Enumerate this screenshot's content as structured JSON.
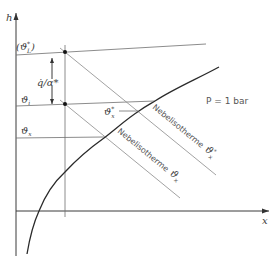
{
  "diagram": {
    "axes": {
      "y_label": "h",
      "x_label": "x"
    },
    "pressure_label": "P = 1 bar",
    "left_labels": {
      "theta_L_star": "(ϑ*L)",
      "theta_L_star_main": "ϑ",
      "theta_L_star_sup": "*",
      "theta_L_star_sub": "L",
      "theta_i": "ϑ",
      "theta_i_sub": "i",
      "theta_x": "ϑ",
      "theta_x_sub": "x"
    },
    "flux_label": {
      "numerator": "q̇",
      "slash": "/",
      "denominator": "α*"
    },
    "inner_label": {
      "main": "ϑ",
      "sup": "*",
      "sub": "x"
    },
    "isotherms": [
      {
        "text": "Nebelisotherme",
        "symbol": "ϑ",
        "sup": "*",
        "sub": "x"
      },
      {
        "text": "Nebelisotherme",
        "symbol": "ϑ",
        "sup": "",
        "sub": "x"
      }
    ],
    "colors": {
      "axis": "#3a3a3a",
      "saturation_curve": "#2a2a2a",
      "isotherm": "#8a8a8a",
      "point": "#111111"
    }
  }
}
